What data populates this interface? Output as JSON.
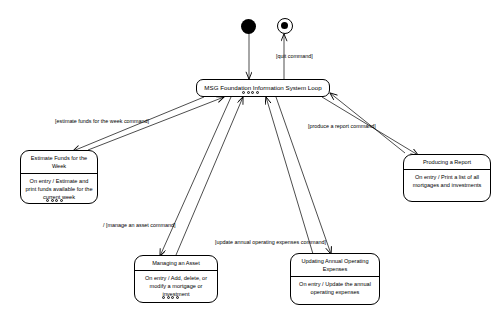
{
  "diagram": {
    "markers": {
      "initial": "initial-state-marker",
      "final": "final-state-marker"
    },
    "states": [
      {
        "id": "loop",
        "name": "MSG Foundation Information System  Loop",
        "activity": ""
      },
      {
        "id": "estimate_funds",
        "name": "Estimate Funds for the Week",
        "activity": "On entry / Estimate  and print funds available for the current week"
      },
      {
        "id": "producing_report",
        "name": "Producing a Report",
        "activity": "On entry / Print a list of all mortgages and investments"
      },
      {
        "id": "managing_asset",
        "name": "Managing an Asset",
        "activity": "On entry / Add, delete, or modify a  mortgage or investment"
      },
      {
        "id": "updating_expenses",
        "name": "Updating Annual Operating Expenses",
        "activity": "On entry / Update the annual operating expenses"
      }
    ],
    "transitions": [
      {
        "id": "quit",
        "label": "[quit command]"
      },
      {
        "id": "estimate",
        "label": "[estimate funds for the week command]"
      },
      {
        "id": "report",
        "label": "[produce a report command]"
      },
      {
        "id": "manage",
        "label": "/ [manage an asset  command]"
      },
      {
        "id": "expenses",
        "label": "[update annual operating expenses  command]"
      }
    ],
    "colors": {
      "line": "#000000",
      "background": "#ffffff",
      "handle": "#cfcfcf"
    }
  }
}
